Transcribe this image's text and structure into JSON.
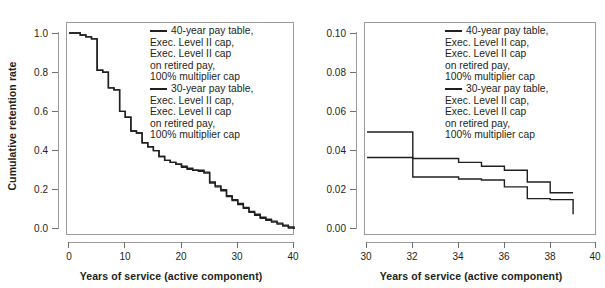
{
  "page": {
    "faint_top_text": "",
    "background": "#ffffff",
    "line_color": "#231f20",
    "axis_color": "#9b9b9b"
  },
  "panels": [
    {
      "id": "left",
      "ylabel": "Cumulative retention rate",
      "xlabel": "Years of service (active component)",
      "yticks": [
        "0.0",
        "0.2",
        "0.4",
        "0.6",
        "0.8",
        "1.0"
      ],
      "xticks": [
        "0",
        "10",
        "20",
        "30",
        "40"
      ],
      "legend": [
        {
          "swatch_color": "#231f20",
          "text": "40-year pay table,\nExec. Level II cap,\nExec. Level II cap\non retired pay,\n100% multiplier cap"
        },
        {
          "swatch_color": "#231f20",
          "text": "30-year pay table,\nExec. Level II cap,\nExec. Level II cap\non retired pay,\n100% multiplier cap"
        }
      ]
    },
    {
      "id": "right",
      "ylabel": "",
      "xlabel": "Years of service (active component)",
      "yticks": [
        "0.00",
        "0.02",
        "0.04",
        "0.06",
        "0.08",
        "0.10"
      ],
      "xticks": [
        "30",
        "32",
        "34",
        "36",
        "38",
        "40"
      ],
      "legend": [
        {
          "swatch_color": "#231f20",
          "text": "40-year pay table,\nExec. Level II cap,\nExec. Level II cap\non retired pay,\n100% multiplier cap"
        },
        {
          "swatch_color": "#231f20",
          "text": "30-year pay table,\nExec. Level II cap,\nExec. Level II cap\non retired pay,\n100% multiplier cap"
        }
      ]
    }
  ],
  "chart_data": [
    {
      "type": "line",
      "id": "left-panel-cumulative-retention",
      "title": "",
      "xlabel": "Years of service (active component)",
      "ylabel": "Cumulative retention rate",
      "xlim": [
        0,
        40
      ],
      "ylim": [
        0.0,
        1.0
      ],
      "xticks": [
        0,
        10,
        20,
        30,
        40
      ],
      "yticks": [
        0.0,
        0.2,
        0.4,
        0.6,
        0.8,
        1.0
      ],
      "grid": false,
      "legend_position": "inside-top-right",
      "step_style": "post",
      "series": [
        {
          "name": "40-year pay table, Exec. Level II cap, Exec. Level II cap on retired pay, 100% multiplier cap",
          "color": "#231f20",
          "x": [
            0,
            1,
            2,
            3,
            4,
            5,
            6,
            7,
            8,
            9,
            10,
            11,
            12,
            13,
            14,
            15,
            16,
            17,
            18,
            19,
            20,
            21,
            22,
            23,
            24,
            25,
            26,
            27,
            28,
            29,
            30,
            31,
            32,
            33,
            34,
            35,
            36,
            37,
            38,
            39,
            40
          ],
          "y": [
            1.0,
            1.0,
            0.99,
            0.98,
            0.97,
            0.81,
            0.8,
            0.72,
            0.71,
            0.6,
            0.57,
            0.5,
            0.49,
            0.44,
            0.42,
            0.4,
            0.37,
            0.35,
            0.34,
            0.33,
            0.32,
            0.31,
            0.3,
            0.3,
            0.29,
            0.24,
            0.22,
            0.2,
            0.17,
            0.15,
            0.13,
            0.11,
            0.09,
            0.075,
            0.06,
            0.05,
            0.04,
            0.03,
            0.02,
            0.01,
            0.0
          ]
        },
        {
          "name": "30-year pay table, Exec. Level II cap, Exec. Level II cap on retired pay, 100% multiplier cap",
          "color": "#231f20",
          "x": [
            0,
            1,
            2,
            3,
            4,
            5,
            6,
            7,
            8,
            9,
            10,
            11,
            12,
            13,
            14,
            15,
            16,
            17,
            18,
            19,
            20,
            21,
            22,
            23,
            24,
            25,
            26,
            27,
            28,
            29,
            30,
            31,
            32,
            33,
            34,
            35,
            36,
            37,
            38,
            39,
            40
          ],
          "y": [
            1.0,
            1.0,
            0.99,
            0.98,
            0.97,
            0.81,
            0.8,
            0.72,
            0.71,
            0.6,
            0.57,
            0.5,
            0.49,
            0.44,
            0.42,
            0.4,
            0.37,
            0.35,
            0.34,
            0.33,
            0.315,
            0.305,
            0.3,
            0.295,
            0.285,
            0.235,
            0.215,
            0.195,
            0.165,
            0.145,
            0.125,
            0.105,
            0.085,
            0.07,
            0.055,
            0.045,
            0.035,
            0.025,
            0.015,
            0.005,
            0.0
          ]
        }
      ],
      "notes": "Left panel: the two series are visually nearly coincident across the full range; the 30-year curve sits marginally below the 40-year curve after about 20 years of service."
    },
    {
      "type": "line",
      "id": "right-panel-zoom-30-to-40",
      "title": "",
      "xlabel": "Years of service (active component)",
      "ylabel": "",
      "xlim": [
        30,
        40
      ],
      "ylim": [
        0.0,
        0.1
      ],
      "xticks": [
        30,
        32,
        34,
        36,
        38,
        40
      ],
      "yticks": [
        0.0,
        0.02,
        0.04,
        0.06,
        0.08,
        0.1
      ],
      "grid": false,
      "legend_position": "inside-top-right",
      "step_style": "post",
      "series": [
        {
          "name": "40-year pay table, Exec. Level II cap, Exec. Level II cap on retired pay, 100% multiplier cap",
          "color": "#231f20",
          "x": [
            30,
            31,
            32,
            33,
            34,
            35,
            36,
            37,
            38,
            39
          ],
          "y": [
            0.0365,
            0.0365,
            0.036,
            0.036,
            0.034,
            0.032,
            0.03,
            0.024,
            0.0185,
            0.0185
          ]
        },
        {
          "name": "30-year pay table, Exec. Level II cap, Exec. Level II cap on retired pay, 100% multiplier cap",
          "color": "#231f20",
          "x": [
            30,
            31,
            32,
            33,
            34,
            35,
            36,
            37,
            38,
            39
          ],
          "y": [
            0.0495,
            0.0495,
            0.0265,
            0.0265,
            0.0255,
            0.025,
            0.0215,
            0.0155,
            0.015,
            0.0075
          ]
        }
      ],
      "notes": "Right panel is a magnified view of the 30-40 year region. One series starts near 0.050 at YOS 30 and drops sharply to about 0.026 at YOS 32; the other starts near 0.036 and declines gradually, crossing the first series near YOS 31.5."
    }
  ]
}
